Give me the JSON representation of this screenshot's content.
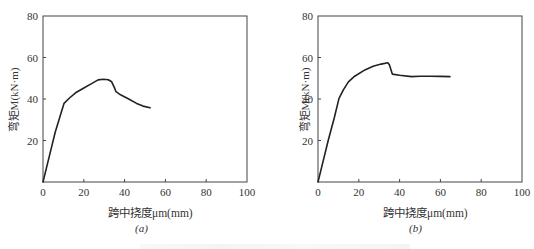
{
  "chart_data": [
    {
      "type": "line",
      "panel": "(a)",
      "title": "",
      "xlabel": "跨中挠度μm(mm)",
      "ylabel": "弯矩M(kN·m)",
      "xlim": [
        0,
        100
      ],
      "ylim": [
        0,
        80
      ],
      "xticks": [
        0,
        20,
        40,
        60,
        80,
        100
      ],
      "yticks": [
        20,
        40,
        60,
        80
      ],
      "grid": false,
      "legend": null,
      "series": [
        {
          "name": "M-μm curve (a)",
          "x": [
            0,
            3,
            6,
            8.5,
            10.3,
            13,
            16,
            19.8,
            24,
            27,
            29.6,
            32,
            33.7,
            35,
            35.8,
            38,
            42,
            45.9,
            49,
            52.5
          ],
          "y": [
            0,
            12,
            24,
            32,
            37.9,
            40.5,
            43,
            45.2,
            47.5,
            49.2,
            49.5,
            49.3,
            48.3,
            45.5,
            43.5,
            42,
            40,
            37.9,
            36.6,
            35.8
          ]
        }
      ]
    },
    {
      "type": "line",
      "panel": "(b)",
      "title": "",
      "xlabel": "跨中挠度μm(mm)",
      "ylabel": "弯矩M(kN·m)",
      "xlim": [
        0,
        100
      ],
      "ylim": [
        0,
        80
      ],
      "xticks": [
        0,
        20,
        40,
        60,
        80,
        100
      ],
      "yticks": [
        20,
        40,
        60,
        80
      ],
      "grid": false,
      "legend": null,
      "series": [
        {
          "name": "M-μm curve (b)",
          "x": [
            0,
            2,
            5,
            8,
            10.3,
            12.5,
            14.9,
            18,
            23,
            27,
            31,
            34.2,
            35,
            36.4,
            40,
            45.9,
            50,
            55,
            60,
            64.7
          ],
          "y": [
            0,
            8,
            20,
            31,
            40.3,
            44.5,
            48.3,
            51,
            54,
            55.8,
            56.8,
            57.5,
            56.5,
            52.0,
            51.4,
            50.8,
            51.0,
            51.0,
            50.9,
            50.8
          ]
        }
      ]
    }
  ],
  "panels": [
    {
      "sublabel": "(a)",
      "xlabel": "跨中挠度μm(mm)",
      "ylabel": "弯矩M(kN·m)",
      "xtick_labels": [
        "0",
        "20",
        "40",
        "60",
        "80",
        "100"
      ],
      "ytick_labels": [
        "20",
        "40",
        "60",
        "80"
      ]
    },
    {
      "sublabel": "(b)",
      "xlabel": "跨中挠度μm(mm)",
      "ylabel": "弯矩M(kN·m)",
      "xtick_labels": [
        "0",
        "20",
        "40",
        "60",
        "80",
        "100"
      ],
      "ytick_labels": [
        "20",
        "40",
        "60",
        "80"
      ]
    }
  ],
  "colors": {
    "axis": "#444444",
    "curve": "#222222",
    "background": "#ffffff"
  }
}
